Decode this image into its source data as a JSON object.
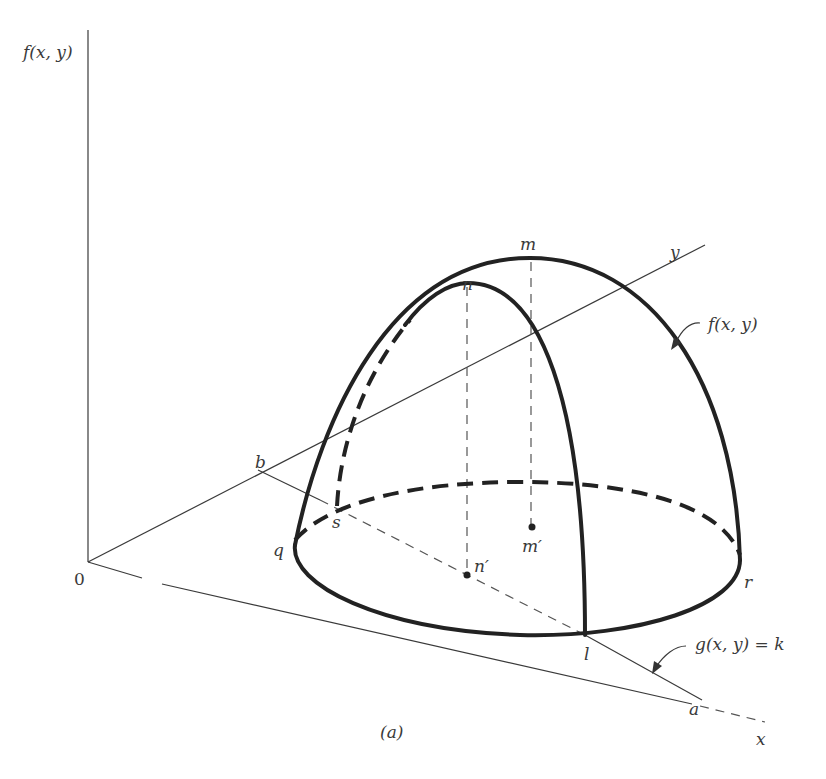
{
  "figure": {
    "caption": "(a)",
    "axes": {
      "vertical_label": "f(x, y)",
      "x_label": "x",
      "y_label": "y",
      "origin_label": "0"
    },
    "points": {
      "m": "m",
      "n": "n",
      "m_prime": "m′",
      "n_prime": "n′",
      "q": "q",
      "r": "r",
      "s": "s",
      "l": "l",
      "a": "a",
      "b": "b"
    },
    "annotations": {
      "surface": "f(x, y)",
      "constraint": "g(x, y) = k"
    },
    "colors": {
      "ink": "#222222",
      "background": "#ffffff"
    }
  }
}
